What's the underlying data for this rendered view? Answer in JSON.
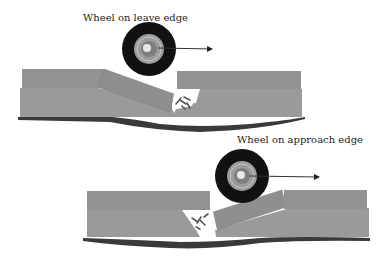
{
  "diagram": {
    "top_panel": {
      "label": "Wheel on leave edge",
      "wheel_center": [
        149,
        49
      ],
      "arrow_direction": "right"
    },
    "bottom_panel": {
      "label": "Wheel on approach edge",
      "wheel_center": [
        238,
        176
      ],
      "arrow_direction": "right"
    },
    "colors": {
      "slab": "#9a9a9a",
      "slab_edge": "#8a8a8a",
      "subgrade": "#3a3a3a",
      "tire": "#111111",
      "hub": "#9c9c9c",
      "debris": "#555555"
    }
  }
}
